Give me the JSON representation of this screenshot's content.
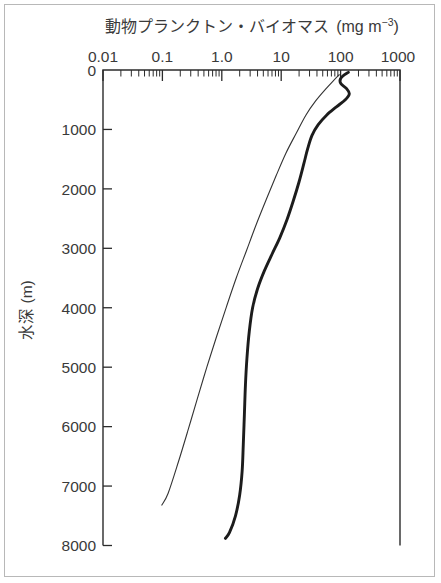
{
  "figure": {
    "background_color": "#ffffff",
    "border_color": "#b8b8b8",
    "ink_color": "#2b2b2b"
  },
  "chart_data": {
    "type": "line",
    "title_main": "動物プランクトン・バイオマス",
    "title_unit_open": "(mg m",
    "title_unit_exp": "−3",
    "title_unit_close": ")",
    "xlabel": "",
    "ylabel": "水深 (m)",
    "xscale": "log",
    "yscale": "linear",
    "x_axis_position": "top",
    "y_axis_inverted": true,
    "xlim": [
      0.01,
      1000
    ],
    "ylim": [
      0,
      8000
    ],
    "xticks": [
      0.01,
      0.1,
      1.0,
      10,
      100,
      1000
    ],
    "xtick_labels": [
      "0.01",
      "0.1",
      "1.0",
      "10",
      "100",
      "1000"
    ],
    "yticks": [
      0,
      1000,
      2000,
      3000,
      4000,
      5000,
      6000,
      7000,
      8000
    ],
    "ytick_labels": [
      "0",
      "1000",
      "2000",
      "3000",
      "4000",
      "5000",
      "6000",
      "7000",
      "8000"
    ],
    "grid": false,
    "legend": "none",
    "minor_ticks": "log-decade",
    "series": [
      {
        "name": "thin-profile",
        "style": "thin",
        "linewidth": 1.1,
        "color": "#333333",
        "points": [
          {
            "biomass": 95.0,
            "depth": 80
          },
          {
            "biomass": 74.0,
            "depth": 190
          },
          {
            "biomass": 55.0,
            "depth": 330
          },
          {
            "biomass": 38.0,
            "depth": 520
          },
          {
            "biomass": 26.0,
            "depth": 760
          },
          {
            "biomass": 18.0,
            "depth": 1060
          },
          {
            "biomass": 12.0,
            "depth": 1400
          },
          {
            "biomass": 8.2,
            "depth": 1780
          },
          {
            "biomass": 5.6,
            "depth": 2180
          },
          {
            "biomass": 3.8,
            "depth": 2600
          },
          {
            "biomass": 2.6,
            "depth": 3040
          },
          {
            "biomass": 1.75,
            "depth": 3500
          },
          {
            "biomass": 1.2,
            "depth": 3980
          },
          {
            "biomass": 0.82,
            "depth": 4480
          },
          {
            "biomass": 0.56,
            "depth": 5000
          },
          {
            "biomass": 0.39,
            "depth": 5520
          },
          {
            "biomass": 0.27,
            "depth": 6060
          },
          {
            "biomass": 0.185,
            "depth": 6600
          },
          {
            "biomass": 0.125,
            "depth": 7120
          },
          {
            "biomass": 0.098,
            "depth": 7320
          }
        ]
      },
      {
        "name": "thick-profile",
        "style": "thick",
        "linewidth": 2.9,
        "color": "#1c1c1c",
        "points": [
          {
            "biomass": 135.0,
            "depth": 40
          },
          {
            "biomass": 108.0,
            "depth": 105
          },
          {
            "biomass": 98.0,
            "depth": 170
          },
          {
            "biomass": 102.0,
            "depth": 235
          },
          {
            "biomass": 125.0,
            "depth": 310
          },
          {
            "biomass": 140.0,
            "depth": 400
          },
          {
            "biomass": 120.0,
            "depth": 500
          },
          {
            "biomass": 85.0,
            "depth": 620
          },
          {
            "biomass": 58.0,
            "depth": 760
          },
          {
            "biomass": 42.0,
            "depth": 920
          },
          {
            "biomass": 33.0,
            "depth": 1100
          },
          {
            "biomass": 28.0,
            "depth": 1320
          },
          {
            "biomass": 24.0,
            "depth": 1580
          },
          {
            "biomass": 20.0,
            "depth": 1880
          },
          {
            "biomass": 16.0,
            "depth": 2200
          },
          {
            "biomass": 12.5,
            "depth": 2520
          },
          {
            "biomass": 9.5,
            "depth": 2820
          },
          {
            "biomass": 7.0,
            "depth": 3100
          },
          {
            "biomass": 5.2,
            "depth": 3380
          },
          {
            "biomass": 4.0,
            "depth": 3680
          },
          {
            "biomass": 3.3,
            "depth": 4000
          },
          {
            "biomass": 2.9,
            "depth": 4400
          },
          {
            "biomass": 2.65,
            "depth": 4850
          },
          {
            "biomass": 2.5,
            "depth": 5300
          },
          {
            "biomass": 2.4,
            "depth": 5800
          },
          {
            "biomass": 2.3,
            "depth": 6300
          },
          {
            "biomass": 2.2,
            "depth": 6750
          },
          {
            "biomass": 2.0,
            "depth": 7150
          },
          {
            "biomass": 1.7,
            "depth": 7500
          },
          {
            "biomass": 1.35,
            "depth": 7780
          },
          {
            "biomass": 1.15,
            "depth": 7880
          }
        ]
      }
    ]
  }
}
